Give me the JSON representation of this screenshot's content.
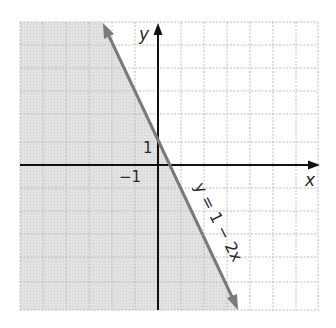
{
  "graph": {
    "equation_label": "y = 1 − 2x",
    "x_axis_label": "x",
    "y_axis_label": "y",
    "tick_labels": {
      "x_neg1": "−1",
      "y_1": "1"
    },
    "colors": {
      "line": "#7a7a7a",
      "axis": "#111111",
      "grid": "#b8b8b8",
      "shade": "#e4e4e4"
    },
    "line": {
      "slope": -2,
      "intercept": 1
    },
    "shaded_region": "below/left of line (y < 1 − 2x)",
    "grid_range": {
      "x": [
        -6,
        7
      ],
      "y": [
        -6,
        6
      ]
    }
  }
}
